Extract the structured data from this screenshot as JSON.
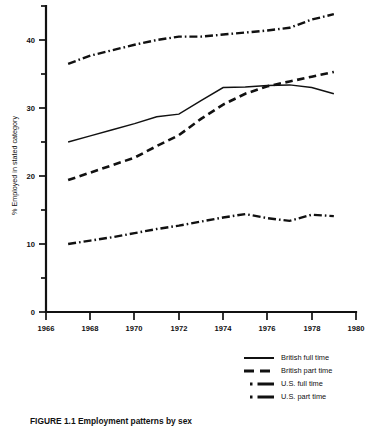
{
  "chart_data": {
    "type": "line",
    "title": "",
    "xlabel": "",
    "ylabel": "% Employed in stated category",
    "xlim": [
      1966,
      1980
    ],
    "ylim": [
      0,
      45
    ],
    "xticks": [
      1966,
      1968,
      1970,
      1972,
      1974,
      1976,
      1978,
      1980
    ],
    "xtick_labels": [
      "1966",
      "1968",
      "1970",
      "1972",
      "1974",
      "1976",
      "1978",
      "1980"
    ],
    "yticks": [
      0,
      10,
      20,
      30,
      40
    ],
    "ytick_labels": [
      "0",
      "10",
      "20",
      "30",
      "40"
    ],
    "y_minor_ticks": [
      5,
      15,
      25,
      35,
      45
    ],
    "grid": false,
    "legend_position": "bottom-right",
    "x": [
      1967,
      1968,
      1969,
      1970,
      1971,
      1972,
      1973,
      1974,
      1975,
      1976,
      1977,
      1978,
      1979
    ],
    "series": [
      {
        "name": "British full time",
        "style": "solid",
        "values": [
          25.0,
          25.9,
          26.8,
          27.7,
          28.7,
          29.1,
          31.1,
          33.0,
          33.1,
          33.3,
          33.4,
          33.0,
          32.1
        ]
      },
      {
        "name": "British part time",
        "style": "dashed",
        "values": [
          19.4,
          20.5,
          21.6,
          22.7,
          24.4,
          26.0,
          28.4,
          30.5,
          32.1,
          33.2,
          33.9,
          34.6,
          35.3
        ]
      },
      {
        "name": "U.S. full time",
        "style": "dash-dot",
        "values": [
          36.5,
          37.7,
          38.5,
          39.3,
          40.0,
          40.5,
          40.5,
          40.8,
          41.1,
          41.4,
          41.8,
          43.0,
          43.8
        ]
      },
      {
        "name": "U.S. part time",
        "style": "dash-dot",
        "values": [
          10.0,
          10.5,
          11.0,
          11.6,
          12.2,
          12.7,
          13.3,
          13.9,
          14.4,
          13.8,
          13.4,
          14.3,
          14.1
        ]
      }
    ]
  },
  "axes": {
    "y_title": "% Employed in stated category"
  },
  "legend": {
    "items": [
      {
        "label": "British full time",
        "key": "solid-line-key"
      },
      {
        "label": "British part time",
        "key": "dashed-line-key"
      },
      {
        "label": "U.S. full time",
        "key": "dash-dot-line-key"
      },
      {
        "label": "U.S. part time",
        "key": "dash-dot-line-key"
      }
    ]
  },
  "caption": {
    "text": "FIGURE 1.1  Employment patterns by sex"
  }
}
